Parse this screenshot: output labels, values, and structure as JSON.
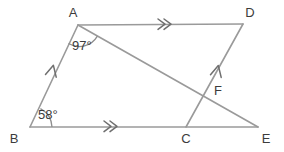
{
  "figure": {
    "type": "euclidean-geometry-diagram",
    "width": 284,
    "height": 152,
    "stroke_color": "#9a9a9a",
    "label_color": "#3c3c3c",
    "background_color": "#ffffff"
  },
  "vertices": [
    {
      "id": "A",
      "label": "A",
      "x": 78,
      "y": 25,
      "label_x": 73,
      "label_y": 17
    },
    {
      "id": "B",
      "label": "B",
      "x": 30,
      "y": 127,
      "label_x": 14,
      "label_y": 143
    },
    {
      "id": "C",
      "label": "C",
      "x": 186,
      "y": 127,
      "label_x": 184,
      "label_y": 143
    },
    {
      "id": "D",
      "label": "D",
      "x": 243,
      "y": 24,
      "label_x": 249,
      "label_y": 17
    },
    {
      "id": "E",
      "label": "E",
      "x": 258,
      "y": 127,
      "label_x": 262,
      "label_y": 143
    },
    {
      "id": "F",
      "label": "F",
      "x": 206,
      "y": 93,
      "label_x": 212,
      "label_y": 94
    }
  ],
  "segments": [
    {
      "id": "AD",
      "from": "A",
      "to": "D",
      "marker": "double-chevron"
    },
    {
      "id": "BE",
      "from": "B",
      "to": "E",
      "marker": "double-chevron"
    },
    {
      "id": "BA",
      "from": "B",
      "to": "A",
      "marker": "single-arrow"
    },
    {
      "id": "CD",
      "from": "C",
      "to": "D",
      "marker": "single-arrow"
    },
    {
      "id": "AE",
      "from": "A",
      "to": "E",
      "marker": "none"
    }
  ],
  "angles": [
    {
      "id": "angle-A",
      "vertex": "A",
      "value": "97°",
      "label_x": 72,
      "label_y": 49
    },
    {
      "id": "angle-B",
      "vertex": "B",
      "value": "58°",
      "label_x": 38,
      "label_y": 119
    }
  ],
  "markers": {
    "ad_chevron": {
      "x": 163,
      "y": 24
    },
    "be_chevron": {
      "x": 110,
      "y": 126
    },
    "ba_arrow": {
      "x": 52,
      "y": 69
    },
    "cd_arrow": {
      "x": 216,
      "y": 70
    }
  }
}
